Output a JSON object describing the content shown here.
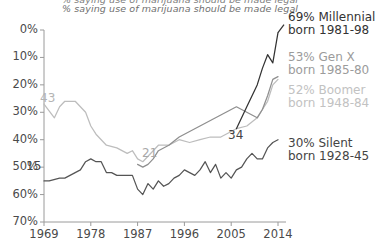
{
  "header": {
    "clipped_title": "% saying use of marijuana should be made legal",
    "subtitle": "% saying use of marijuana should be made legal"
  },
  "axes": {
    "yticks": [
      "70%",
      "60%",
      "50%",
      "40%",
      "30%",
      "20%",
      "10%",
      "0%"
    ],
    "xticks": [
      "1969",
      "1978",
      "1987",
      "1996",
      "2005",
      "2014"
    ]
  },
  "annotations": [
    {
      "name": "silent-start-value",
      "text": "15",
      "color": "#444444"
    },
    {
      "name": "boomer-start-value",
      "text": "43",
      "color": "#b4b4b4"
    },
    {
      "name": "genx-start-value",
      "text": "21",
      "color": "#a8a8a8"
    },
    {
      "name": "millennial-start-value",
      "text": "34",
      "color": "#444444"
    }
  ],
  "legend": [
    {
      "name": "millennial",
      "line1": "69% Millennial",
      "line2": "born 1981-98",
      "color": "#333333"
    },
    {
      "name": "genx",
      "line1": "53% Gen X",
      "line2": "born 1985-80",
      "color": "#9b9b9b"
    },
    {
      "name": "boomer",
      "line1": "52% Boomer",
      "line2": "born 1948-84",
      "color": "#c2c2c2"
    },
    {
      "name": "silent",
      "line1": "30% Silent",
      "line2": "born 1928-45",
      "color": "#444444"
    }
  ],
  "colors": {
    "millennial": "#333333",
    "genx": "#8f8f8f",
    "boomer": "#bdbdbd",
    "silent": "#555555",
    "axis": "#9a9a9a",
    "text": "#4a4a4a"
  },
  "chart_data": {
    "type": "line",
    "title": "% saying use of marijuana should be made legal",
    "xlabel": "",
    "ylabel": "",
    "xlim": [
      1969,
      2014
    ],
    "ylim": [
      0,
      70
    ],
    "ytick_values": [
      0,
      10,
      20,
      30,
      40,
      50,
      60,
      70
    ],
    "xtick_values": [
      1969,
      1978,
      1987,
      1996,
      2005,
      2014
    ],
    "grid": false,
    "legend_position": "right",
    "series": [
      {
        "name": "Silent",
        "label": "30% Silent born 1928-45",
        "color": "#555555",
        "start_value": 15,
        "end_value": 30,
        "x": [
          1969,
          1970,
          1972,
          1973,
          1975,
          1976,
          1977,
          1978,
          1979,
          1980,
          1981,
          1982,
          1983,
          1984,
          1985,
          1986,
          1987,
          1988,
          1989,
          1990,
          1991,
          1992,
          1993,
          1994,
          1995,
          1996,
          1997,
          1998,
          1999,
          2000,
          2001,
          2002,
          2003,
          2004,
          2005,
          2006,
          2007,
          2008,
          2009,
          2010,
          2011,
          2012,
          2013,
          2014
        ],
        "y": [
          15,
          15,
          16,
          16,
          18,
          19,
          22,
          23,
          22,
          22,
          18,
          18,
          17,
          17,
          17,
          17,
          12,
          10,
          14,
          12,
          15,
          13,
          14,
          16,
          17,
          19,
          18,
          17,
          19,
          22,
          18,
          21,
          16,
          18,
          16,
          19,
          20,
          23,
          25,
          23,
          23,
          27,
          29,
          30
        ]
      },
      {
        "name": "Boomer",
        "label": "52% Boomer born 1948-84",
        "color": "#bdbdbd",
        "start_value": 43,
        "end_value": 52,
        "x": [
          1969,
          1971,
          1972,
          1973,
          1975,
          1977,
          1978,
          1979,
          1980,
          1981,
          1983,
          1985,
          1986,
          1987,
          1988,
          1989,
          1990,
          1991,
          1993,
          1995,
          1997,
          1999,
          2001,
          2003,
          2005,
          2006,
          2008,
          2010,
          2011,
          2012,
          2013,
          2014
        ],
        "y": [
          43,
          38,
          42,
          44,
          44,
          40,
          35,
          32,
          30,
          28,
          27,
          25,
          26,
          23,
          22,
          24,
          26,
          28,
          28,
          30,
          29,
          30,
          31,
          31,
          33,
          34,
          35,
          38,
          41,
          44,
          50,
          52
        ]
      },
      {
        "name": "Gen X",
        "label": "53% Gen X born 1985-80",
        "color": "#8f8f8f",
        "start_value": 21,
        "end_value": 53,
        "x": [
          1987,
          1988,
          1989,
          1990,
          1991,
          1993,
          1995,
          1997,
          1999,
          2001,
          2003,
          2005,
          2006,
          2008,
          2010,
          2011,
          2012,
          2013,
          2014
        ],
        "y": [
          21,
          20,
          21,
          23,
          26,
          28,
          31,
          33,
          35,
          37,
          39,
          41,
          42,
          40,
          38,
          41,
          46,
          52,
          53
        ]
      },
      {
        "name": "Millennial",
        "label": "69% Millennial born 1981-98",
        "color": "#333333",
        "start_value": 34,
        "end_value": 69,
        "x": [
          2006,
          2008,
          2010,
          2011,
          2012,
          2013,
          2014
        ],
        "y": [
          34,
          42,
          50,
          56,
          61,
          58,
          69
        ]
      }
    ]
  }
}
